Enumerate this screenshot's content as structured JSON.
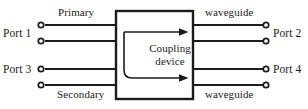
{
  "diagram": {
    "device": {
      "label_line1": "Coupling",
      "label_line2": "device",
      "shape": "rectangle"
    },
    "ports": {
      "left_top": "Port 1",
      "left_bottom": "Port 3",
      "right_top": "Port 2",
      "right_bottom": "Port 4"
    },
    "lines": {
      "primary": "Primary",
      "secondary": "Secondary",
      "waveguide_top": "waveguide",
      "waveguide_bottom": "waveguide"
    },
    "colors": {
      "stroke": "#1b1b1b",
      "background": "#ffffff",
      "text": "#1b1b1b"
    },
    "arrows": [
      {
        "name": "primary-through-arrow",
        "direction": "right"
      },
      {
        "name": "coupled-branch-arrow",
        "direction": "right"
      }
    ]
  }
}
